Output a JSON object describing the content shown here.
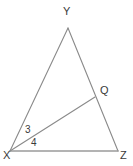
{
  "figure": {
    "kind": "geometry-diagram",
    "shape": "triangle-with-cevian",
    "background_color": "#ffffff",
    "stroke_color": "#8a8a8a",
    "base_stroke_color": "#9a9a9a",
    "text_color": "#3a3a3a",
    "width": 133,
    "height": 166
  },
  "vertices": {
    "Y": {
      "label": "Y",
      "x": 68,
      "y": 28
    },
    "X": {
      "label": "X",
      "x": 10,
      "y": 151
    },
    "Z": {
      "label": "Z",
      "x": 118,
      "y": 151
    },
    "Q": {
      "label": "Q",
      "x": 95,
      "y": 97
    }
  },
  "segments": [
    {
      "name": "XY",
      "from": "X",
      "to": "Y",
      "x1": 10,
      "y1": 151,
      "x2": 68,
      "y2": 28
    },
    {
      "name": "YZ",
      "from": "Y",
      "to": "Z",
      "x1": 68,
      "y1": 28,
      "x2": 118,
      "y2": 151
    },
    {
      "name": "XZ",
      "from": "X",
      "to": "Z",
      "x1": 10,
      "y1": 151,
      "x2": 118,
      "y2": 151
    },
    {
      "name": "XQ",
      "from": "X",
      "to": "Q",
      "x1": 10,
      "y1": 151,
      "x2": 95,
      "y2": 97
    }
  ],
  "angle_labels": [
    {
      "name": "angle-3",
      "label": "3",
      "between": "XY and XQ",
      "at_vertex": "X"
    },
    {
      "name": "angle-4",
      "label": "4",
      "between": "XQ and XZ",
      "at_vertex": "X"
    }
  ]
}
